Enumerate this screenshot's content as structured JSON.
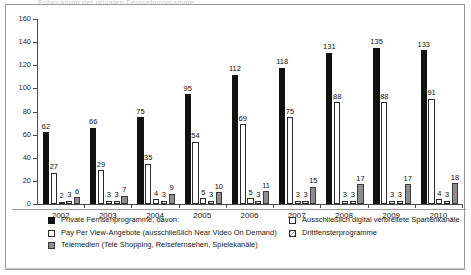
{
  "ghost_title_fragment": "Entwicklung der privaten Fernsehprogramme",
  "chart_data": {
    "type": "bar",
    "title": "",
    "xlabel": "",
    "ylabel": "",
    "ylim": [
      0,
      160
    ],
    "ytick_step": 20,
    "grid": false,
    "legend_position": "bottom",
    "yticks": [
      "0",
      "20",
      "40",
      "60",
      "80",
      "100",
      "120",
      "140",
      "160"
    ],
    "categories": [
      "2002",
      "2003",
      "2004",
      "2005",
      "2006",
      "2007",
      "2008",
      "2009",
      "2010"
    ],
    "series": [
      {
        "name": "Private Fernsehprogramme, davon:",
        "key": "private",
        "style": "black",
        "color": "#111111",
        "values": [
          62,
          66,
          75,
          95,
          112,
          118,
          131,
          135,
          133
        ]
      },
      {
        "name": "Pay Per View-Angebote (ausschließlich Near Video On Demand)",
        "key": "ppv",
        "style": "white",
        "color": "#ffffff",
        "values": [
          27,
          29,
          35,
          54,
          69,
          75,
          88,
          88,
          91
        ]
      },
      {
        "name": "Ausschließlich digital verbreitete Spartenkanäle",
        "key": "spartenkanaele",
        "style": "white-outline",
        "color": "#ffffff",
        "values": [
          2,
          3,
          4,
          5,
          5,
          3,
          3,
          3,
          4
        ]
      },
      {
        "name": "Drittfensterprogramme",
        "key": "drittfenster",
        "style": "hatched",
        "color": "#d6d6d6",
        "values": [
          3,
          3,
          3,
          3,
          3,
          3,
          3,
          3,
          3
        ]
      },
      {
        "name": "Telemedien (Tele Shopping, Reisefernsehen, Spielekanäle)",
        "key": "telemedien",
        "style": "gray",
        "color": "#8d8d8d",
        "values": [
          6,
          7,
          9,
          10,
          11,
          15,
          17,
          17,
          18
        ]
      }
    ]
  },
  "legend": {
    "left": [
      {
        "label": "Private Fernsehprogramme, davon:",
        "swatch": "black"
      },
      {
        "label": "Pay Per View-Angebote (ausschließlich Near Video On Demand)",
        "swatch": "white"
      },
      {
        "label": "Telemedien (Tele Shopping, Reisefernsehen, Spielekanäle)",
        "swatch": "gray"
      }
    ],
    "right": [
      {
        "label": "Ausschließlich digital verbreitete Spartenkanäle",
        "swatch": "white-outline"
      },
      {
        "label": "Drittfensterprogramme",
        "swatch": "hatched"
      }
    ]
  }
}
